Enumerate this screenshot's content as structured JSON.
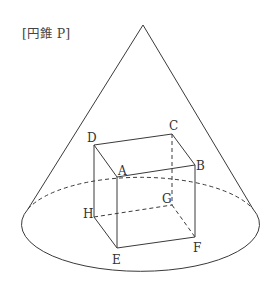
{
  "title": "[円錐 P]",
  "figure": {
    "name": "P",
    "inscribed_solid": "rectangular prism"
  },
  "vertices": {
    "A": "A",
    "B": "B",
    "C": "C",
    "D": "D",
    "E": "E",
    "F": "F",
    "G": "G",
    "H": "H"
  },
  "colors": {
    "line": "#3a3a3a",
    "background": "#ffffff"
  }
}
